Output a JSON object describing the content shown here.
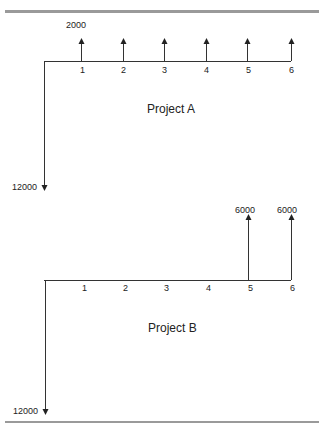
{
  "diagram": {
    "type": "cash-flow-diagram",
    "colors": {
      "line": "#333333",
      "rule": "#9a9a9a",
      "background": "#ffffff"
    },
    "projects": [
      {
        "name": "Project A",
        "initial_outflow": "12000",
        "periods": [
          "1",
          "2",
          "3",
          "4",
          "5",
          "6"
        ],
        "inflow_label": "2000",
        "inflows": [
          2000,
          2000,
          2000,
          2000,
          2000,
          2000
        ]
      },
      {
        "name": "Project B",
        "initial_outflow": "12000",
        "periods": [
          "1",
          "2",
          "3",
          "4",
          "5",
          "6"
        ],
        "inflow_labels": [
          "6000",
          "6000"
        ],
        "inflows": [
          0,
          0,
          0,
          0,
          6000,
          6000
        ]
      }
    ]
  }
}
